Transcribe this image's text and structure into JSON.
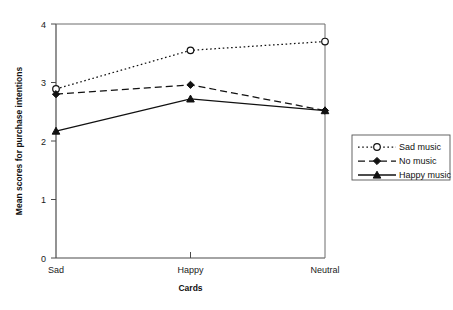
{
  "chart_data": {
    "type": "line",
    "title": "",
    "xlabel": "Cards",
    "ylabel": "Mean scores for purchase intentions",
    "categories": [
      "Sad",
      "Happy",
      "Neutral"
    ],
    "ylim": [
      0,
      4
    ],
    "yticks": [
      0,
      1,
      2,
      3,
      4
    ],
    "ytick_labels": [
      "0",
      "1",
      "2",
      "3",
      "4"
    ],
    "grid": false,
    "legend_position": "right",
    "series": [
      {
        "name": "Sad music",
        "values": [
          2.89,
          3.55,
          3.7
        ],
        "line_style": "dotted",
        "marker": "open-circle",
        "color": "#111111"
      },
      {
        "name": "No music",
        "values": [
          2.8,
          2.96,
          2.52
        ],
        "line_style": "dashed",
        "marker": "filled-diamond",
        "color": "#111111"
      },
      {
        "name": "Happy music",
        "values": [
          2.17,
          2.72,
          2.52
        ],
        "line_style": "solid",
        "marker": "filled-triangle",
        "color": "#111111"
      }
    ]
  },
  "legend": {
    "items": [
      {
        "label": "Sad music"
      },
      {
        "label": "No music"
      },
      {
        "label": "Happy music"
      }
    ]
  },
  "axes": {
    "y_title": "Mean scores for purchase intentions",
    "x_title": "Cards",
    "y_tick_0": "0",
    "y_tick_1": "1",
    "y_tick_2": "2",
    "y_tick_3": "3",
    "y_tick_4": "4",
    "x_tick_0": "Sad",
    "x_tick_1": "Happy",
    "x_tick_2": "Neutral"
  }
}
